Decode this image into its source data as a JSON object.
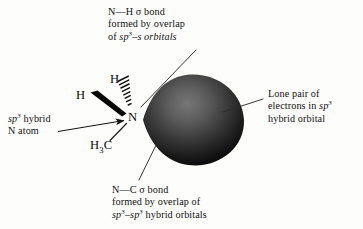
{
  "figure": {
    "background_color": "#fdfdfc",
    "ink_color": "#101010"
  },
  "labels": {
    "top": {
      "name": "n-h-sigma-bond-label",
      "line1_pre": "N",
      "line1_dash": "—",
      "line1_post": "H σ bond",
      "line2": "formed by overlap",
      "line3_pre": "of ",
      "line3_sp": "sp",
      "line3_sup": "3",
      "line3_post": "–s orbitals"
    },
    "right": {
      "name": "lone-pair-label",
      "line1": "Lone pair of",
      "line2_pre": "electrons in ",
      "line2_sp": "sp",
      "line2_sup": "3",
      "line3": "hybrid orbital"
    },
    "left": {
      "name": "sp3-hybrid-n-atom-label",
      "line1_sp": "sp",
      "line1_sup": "3",
      "line1_post": " hybrid",
      "line2": "N atom"
    },
    "bottom": {
      "name": "n-c-sigma-bond-label",
      "line1_pre": "N",
      "line1_dash": "—",
      "line1_post": "C σ bond",
      "line2": "formed by overlap of",
      "line3_sp1": "sp",
      "line3_sup1": "3",
      "line3_dash": "–",
      "line3_sp2": "sp",
      "line3_sup2": "3",
      "line3_post": " hybrid orbitals"
    }
  },
  "atoms": {
    "hydrogen_up": "H",
    "hydrogen_left": "H",
    "nitrogen": "N",
    "methyl_h": "H",
    "methyl_sub": "3",
    "methyl_c": "C"
  },
  "orbital_lobe": {
    "name": "sp3-lone-pair-lobe",
    "shape": "teardrop",
    "highlight_color": "#6e6e6e",
    "mid_color": "#3b3b3b",
    "edge_color": "#080808",
    "tip_x": 143,
    "tip_y": 120,
    "center_x": 196,
    "center_y": 120,
    "width": 106,
    "height": 92
  },
  "bonds": [
    {
      "name": "n-h-hashed-wedge",
      "type": "hashed-wedge",
      "from": "N",
      "to": "H (up)",
      "hash_count": 9,
      "color": "#141414"
    },
    {
      "name": "n-h-solid-wedge",
      "type": "solid-wedge",
      "from": "H (left)",
      "to": "N",
      "color": "#050505"
    },
    {
      "name": "n-c-plain-bond",
      "type": "plain-line",
      "from": "N",
      "to": "H3C",
      "color": "#1a1a1a"
    }
  ],
  "leader_lines": [
    {
      "name": "leader-line-top",
      "from_label": "top",
      "x1": 196,
      "y1": 50,
      "x2": 142,
      "y2": 108
    },
    {
      "name": "leader-line-right",
      "from_label": "right",
      "x1": 262,
      "y1": 100,
      "x2": 222,
      "y2": 112
    },
    {
      "name": "leader-line-bottom",
      "from_label": "bottom",
      "x1": 140,
      "y1": 179,
      "x2": 158,
      "y2": 140
    }
  ],
  "pointer_arrow": {
    "name": "sp3-n-atom-pointer-arrow",
    "x1": 62,
    "y1": 131,
    "x2": 126,
    "y2": 120,
    "head": "triangle"
  }
}
